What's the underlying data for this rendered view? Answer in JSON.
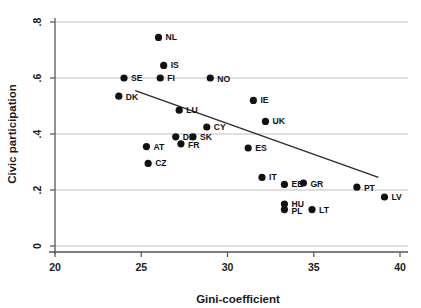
{
  "chart_data": {
    "type": "scatter",
    "title": "",
    "xlabel": "Gini-coefficient",
    "ylabel": "Civic participation",
    "xlim": [
      20,
      40
    ],
    "ylim": [
      0,
      0.8
    ],
    "xticks": [
      "20",
      "25",
      "30",
      "35",
      "40"
    ],
    "xtick_values": [
      20,
      25,
      30,
      35,
      40
    ],
    "yticks": [
      "0",
      ".2",
      ".4",
      ".6",
      ".8"
    ],
    "ytick_values": [
      0,
      0.2,
      0.4,
      0.6,
      0.8
    ],
    "grid": "horizontal",
    "legend": "none",
    "marker_color": "#111111",
    "fit_line_color": "#2b2b2b",
    "gridline_color": "#b8b8b8",
    "points": [
      {
        "label": "NL",
        "x": 26.0,
        "y": 0.745,
        "lx": 7,
        "ly": 3
      },
      {
        "label": "IS",
        "x": 26.3,
        "y": 0.645,
        "lx": 7,
        "ly": 3
      },
      {
        "label": "SE",
        "x": 24.0,
        "y": 0.6,
        "lx": 7,
        "ly": 3
      },
      {
        "label": "FI",
        "x": 26.1,
        "y": 0.6,
        "lx": 7,
        "ly": 3
      },
      {
        "label": "NO",
        "x": 29.0,
        "y": 0.6,
        "lx": 7,
        "ly": 4
      },
      {
        "label": "DK",
        "x": 23.7,
        "y": 0.535,
        "lx": 7,
        "ly": 4
      },
      {
        "label": "IE",
        "x": 31.5,
        "y": 0.52,
        "lx": 7,
        "ly": 3
      },
      {
        "label": "LU",
        "x": 27.2,
        "y": 0.485,
        "lx": 7,
        "ly": 3
      },
      {
        "label": "UK",
        "x": 32.2,
        "y": 0.445,
        "lx": 7,
        "ly": 3
      },
      {
        "label": "CY",
        "x": 28.8,
        "y": 0.425,
        "lx": 7,
        "ly": 3
      },
      {
        "label": "DE",
        "x": 27.0,
        "y": 0.39,
        "lx": 7,
        "ly": 3
      },
      {
        "label": "SK",
        "x": 28.0,
        "y": 0.39,
        "lx": 7,
        "ly": 3
      },
      {
        "label": "FR",
        "x": 27.3,
        "y": 0.365,
        "lx": 7,
        "ly": 4
      },
      {
        "label": "AT",
        "x": 25.3,
        "y": 0.355,
        "lx": 7,
        "ly": 3
      },
      {
        "label": "ES",
        "x": 31.2,
        "y": 0.35,
        "lx": 7,
        "ly": 3
      },
      {
        "label": "CZ",
        "x": 25.4,
        "y": 0.295,
        "lx": 7,
        "ly": 3
      },
      {
        "label": "IT",
        "x": 32.0,
        "y": 0.245,
        "lx": 7,
        "ly": 3
      },
      {
        "label": "EE",
        "x": 33.3,
        "y": 0.22,
        "lx": 7,
        "ly": 3
      },
      {
        "label": "GR",
        "x": 34.4,
        "y": 0.225,
        "lx": 7,
        "ly": 4
      },
      {
        "label": "PT",
        "x": 37.5,
        "y": 0.21,
        "lx": 7,
        "ly": 4
      },
      {
        "label": "LV",
        "x": 39.1,
        "y": 0.175,
        "lx": 7,
        "ly": 3
      },
      {
        "label": "HU",
        "x": 33.3,
        "y": 0.15,
        "lx": 7,
        "ly": 3
      },
      {
        "label": "PL",
        "x": 33.3,
        "y": 0.13,
        "lx": 7,
        "ly": 4
      },
      {
        "label": "LT",
        "x": 34.9,
        "y": 0.13,
        "lx": 7,
        "ly": 3
      }
    ],
    "fit_line": {
      "x1": 24.65,
      "y1": 0.555,
      "x2": 38.75,
      "y2": 0.245
    }
  }
}
